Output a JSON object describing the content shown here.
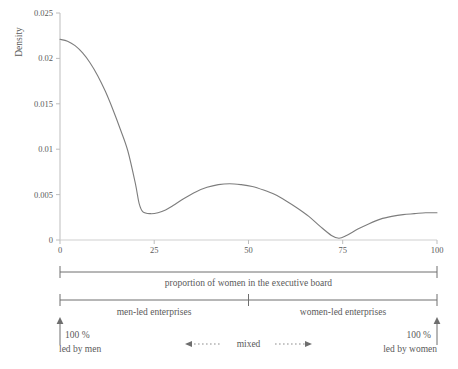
{
  "chart_data": {
    "type": "line",
    "title": "",
    "xlabel": "proportion of women in the executive board",
    "ylabel": "Density",
    "xlim": [
      0,
      100
    ],
    "ylim": [
      0,
      0.025
    ],
    "grid": false,
    "legend": "none",
    "xticks": [
      "0",
      "25",
      "50",
      "75",
      "100"
    ],
    "xtick_values": [
      0,
      25,
      50,
      75,
      100
    ],
    "yticks": [
      "0",
      "0.005",
      "0.01",
      "0.015",
      "0.02",
      "0.025"
    ],
    "ytick_values": [
      0,
      0.005,
      0.01,
      0.015,
      0.02,
      0.025
    ],
    "series": [
      {
        "name": "Density",
        "x": [
          0,
          2,
          4,
          6,
          8,
          10,
          12,
          14,
          16,
          18,
          20,
          21,
          22,
          24,
          26,
          28,
          30,
          33,
          36,
          39,
          42,
          45,
          48,
          51,
          54,
          57,
          60,
          63,
          66,
          69,
          72,
          74,
          76,
          79,
          82,
          85,
          88,
          91,
          94,
          97,
          100
        ],
        "values": [
          0.0221,
          0.0219,
          0.0214,
          0.0206,
          0.0195,
          0.0181,
          0.0164,
          0.0144,
          0.0122,
          0.0098,
          0.0062,
          0.004,
          0.0031,
          0.0029,
          0.003,
          0.0033,
          0.0038,
          0.0046,
          0.0053,
          0.0058,
          0.0061,
          0.0062,
          0.0061,
          0.0059,
          0.0055,
          0.005,
          0.0043,
          0.0035,
          0.0026,
          0.0015,
          0.0005,
          0.0002,
          0.0005,
          0.0012,
          0.0018,
          0.0023,
          0.0026,
          0.0028,
          0.0029,
          0.003,
          0.003
        ]
      }
    ],
    "line_color": "#7d7d7d",
    "axis_color": "#b9b9b9",
    "annotations": {
      "axis_bracket_label": "proportion of women in the executive board",
      "segments": [
        {
          "label": "men-led enterprises",
          "from": 0,
          "to": 50
        },
        {
          "label": "women-led enterprises",
          "from": 50,
          "to": 100
        }
      ],
      "left_marker": {
        "line1": "100 %",
        "line2": "led by men"
      },
      "right_marker": {
        "line1": "100 %",
        "line2": "led by women"
      },
      "middle_marker": {
        "label": "mixed"
      }
    }
  }
}
